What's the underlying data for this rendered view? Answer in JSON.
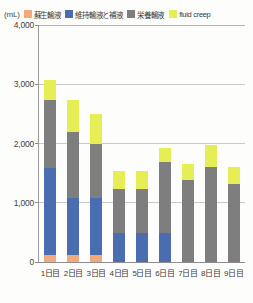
{
  "chart_data": {
    "type": "bar",
    "stacked": true,
    "title": "",
    "xlabel": "",
    "ylabel": "(mL)",
    "unit_label": "(mL)",
    "ylim": [
      0,
      4000
    ],
    "yticks": [
      0,
      1000,
      2000,
      3000,
      4000
    ],
    "ytick_labels": [
      "0",
      "1,000",
      "2,000",
      "3,000",
      "4,000"
    ],
    "grid": true,
    "legend_position": "top",
    "categories": [
      "1日目",
      "2日目",
      "3日目",
      "4日目",
      "5日目",
      "6日目",
      "7日目",
      "8日目",
      "9日目"
    ],
    "series": [
      {
        "name": "蘇生輸液",
        "color": "#F2A97B",
        "values": [
          120,
          120,
          110,
          0,
          0,
          0,
          0,
          0,
          0
        ]
      },
      {
        "name": "維持輸液と補液",
        "color": "#4A6CB0",
        "values": [
          1470,
          960,
          970,
          490,
          490,
          490,
          0,
          0,
          0
        ]
      },
      {
        "name": "栄養輸液",
        "color": "#7E7E7E",
        "values": [
          1140,
          1120,
          920,
          750,
          750,
          1190,
          1390,
          1610,
          1310
        ]
      },
      {
        "name": "fluid creep",
        "color": "#E5EF55",
        "values": [
          350,
          530,
          490,
          300,
          300,
          250,
          270,
          370,
          300
        ]
      }
    ],
    "totals": [
      3080,
      2730,
      2490,
      1540,
      1540,
      1930,
      1660,
      1980,
      1610
    ]
  },
  "legend": {
    "unit": "(mL)",
    "items": [
      {
        "label": "蘇生輸液",
        "color": "#F2A97B"
      },
      {
        "label": "維持輸液と補液",
        "color": "#4A6CB0"
      },
      {
        "label": "栄養輸液",
        "color": "#7E7E7E"
      },
      {
        "label": "fluid creep",
        "color": "#E5EF55"
      }
    ]
  }
}
